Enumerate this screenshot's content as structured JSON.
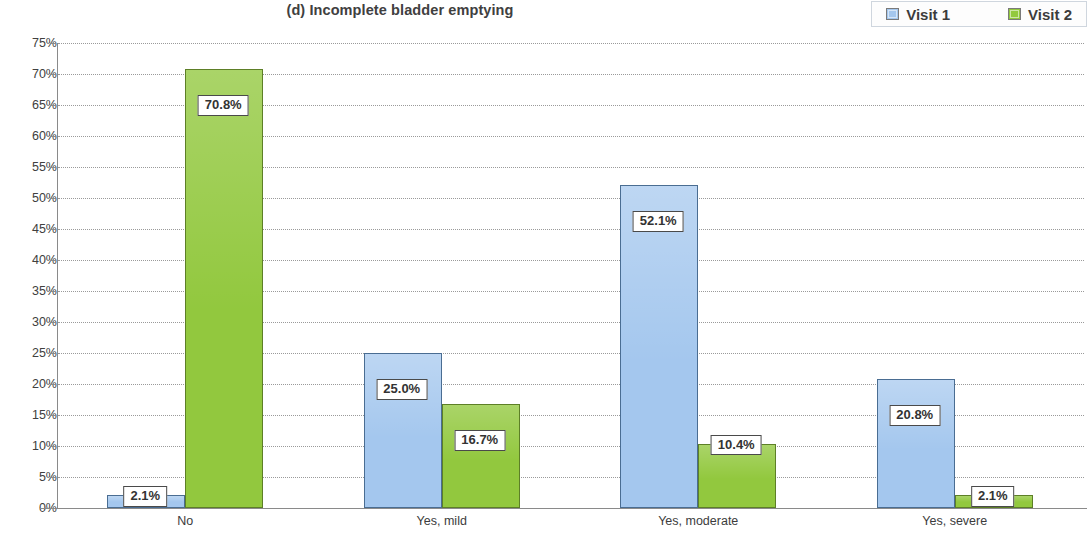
{
  "chart_data": {
    "type": "bar",
    "title": "(d) Incomplete bladder emptying",
    "xlabel": "",
    "ylabel": "",
    "ylim": [
      0,
      75
    ],
    "ytick_labels": [
      "0%",
      "5%",
      "10%",
      "15%",
      "20%",
      "25%",
      "30%",
      "35%",
      "40%",
      "45%",
      "50%",
      "55%",
      "60%",
      "65%",
      "70%",
      "75%"
    ],
    "ytick_values": [
      0,
      5,
      10,
      15,
      20,
      25,
      30,
      35,
      40,
      45,
      50,
      55,
      60,
      65,
      70,
      75
    ],
    "categories": [
      "No",
      "Yes, mild",
      "Yes, moderate",
      "Yes, severe"
    ],
    "grid": true,
    "legend_position": "top-right",
    "series": [
      {
        "name": "Visit 1",
        "color": "#a4c7ee",
        "values": [
          2.1,
          25.0,
          52.1,
          20.8
        ],
        "labels": [
          "2.1%",
          "25.0%",
          "52.1%",
          "20.8%"
        ]
      },
      {
        "name": "Visit 2",
        "color": "#92c83e",
        "values": [
          70.8,
          16.7,
          10.4,
          2.1
        ],
        "labels": [
          "70.8%",
          "16.7%",
          "10.4%",
          "2.1%"
        ]
      }
    ]
  },
  "legend": {
    "items": [
      {
        "label": "Visit 1",
        "color": "#a4c7ee"
      },
      {
        "label": "Visit 2",
        "color": "#92c83e"
      }
    ]
  }
}
